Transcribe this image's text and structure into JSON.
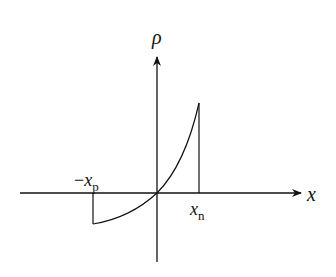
{
  "diagram": {
    "title": "",
    "y_axis_label": "ρ",
    "x_axis_label": "x",
    "left_marker": {
      "prefix": "−",
      "var": "x",
      "sub": "p"
    },
    "right_marker": {
      "var": "x",
      "sub": "n"
    },
    "line_color": "#111111",
    "background": "#ffffff"
  }
}
